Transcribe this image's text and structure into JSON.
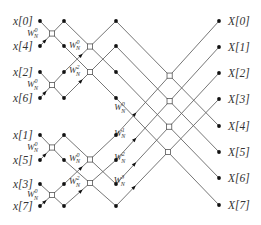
{
  "diagram": {
    "inputs": [
      "x[0]",
      "x[4]",
      "x[2]",
      "x[6]",
      "x[1]",
      "x[5]",
      "x[3]",
      "x[7]"
    ],
    "outputs": [
      "X[0]",
      "X[1]",
      "X[2]",
      "X[3]",
      "X[4]",
      "X[5]",
      "X[6]",
      "X[7]"
    ],
    "twiddle_base": "W",
    "twiddle_sub": "N",
    "stage1_twiddles": [
      "0",
      "0",
      "0",
      "0"
    ],
    "stage2_twiddles": [
      "0",
      "2",
      "0",
      "2"
    ],
    "stage3_twiddles": [
      "0",
      "1",
      "2",
      "3"
    ]
  }
}
